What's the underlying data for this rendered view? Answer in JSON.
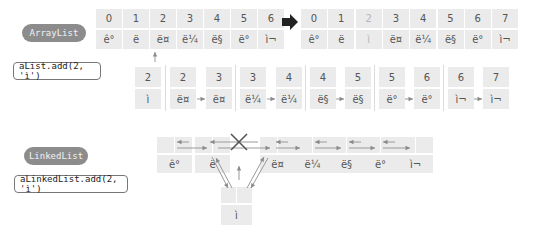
{
  "arraylist": {
    "label": "ArrayList",
    "code": "aList.add(2, 'ì')",
    "before": {
      "indices": [
        "0",
        "1",
        "2",
        "3",
        "4",
        "5",
        "6"
      ],
      "values": [
        "ê°",
        "ë",
        "ë¤",
        "ë¼",
        "ë§",
        "ë°",
        "ì¬"
      ]
    },
    "after": {
      "indices": [
        "0",
        "1",
        "2",
        "3",
        "4",
        "5",
        "6",
        "7"
      ],
      "values": [
        "ê°",
        "ë",
        "ì",
        "ë¤",
        "ë¼",
        "ë§",
        "ë°",
        "ì¬"
      ],
      "inserted_index": 2
    },
    "shift_steps": [
      {
        "index": "2",
        "value": "ì"
      },
      {
        "index": "2",
        "value": "ë¤"
      },
      {
        "index": "3",
        "value": "ë¤"
      },
      {
        "index": "3",
        "value": "ë¼"
      },
      {
        "index": "4",
        "value": "ë¼"
      },
      {
        "index": "4",
        "value": "ë§"
      },
      {
        "index": "5",
        "value": "ë§"
      },
      {
        "index": "5",
        "value": "ë°"
      },
      {
        "index": "6",
        "value": "ë°"
      },
      {
        "index": "6",
        "value": "ì¬"
      },
      {
        "index": "7",
        "value": "ì¬"
      }
    ],
    "transition_icon": "right-arrow-icon"
  },
  "linkedlist": {
    "label": "LinkedList",
    "code": "aLinkedList.add(2, 'ì')",
    "nodes": [
      "ê°",
      "ë",
      "ë¤",
      "ë¼",
      "ë§",
      "ë°",
      "ì¬"
    ],
    "new_node": "ì",
    "broken_link_icon": "cross-icon"
  },
  "colors": {
    "pill_bg": "#8c8c8c",
    "cell_bg": "#ebebeb",
    "arrow": "#999999",
    "text": "#555555"
  }
}
